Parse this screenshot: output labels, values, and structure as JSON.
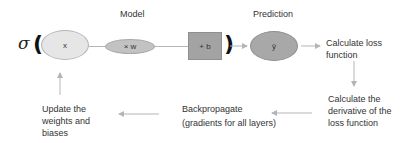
{
  "diagram": {
    "headings": {
      "model": "Model",
      "prediction": "Prediction"
    },
    "formula": {
      "sigma": "σ",
      "open_paren": "(",
      "close_paren": ")",
      "input": "x",
      "weight": "× w",
      "bias": "+ b",
      "output": "ŷ"
    },
    "steps": {
      "calculate_loss": "Calculate loss function",
      "calculate_derivative": "Calculate the derivative of the loss function",
      "backpropagate_line1": "Backpropagate",
      "backpropagate_line2": "(gradients for all layers)",
      "update": "Update the weights and biases"
    },
    "colors": {
      "input_fill": "#e6e6e6",
      "weight_fill": "#c2c2c2",
      "bias_fill": "#a3a3a3",
      "output_fill": "#a8a8a8",
      "arrow": "#b5b5b5"
    }
  }
}
